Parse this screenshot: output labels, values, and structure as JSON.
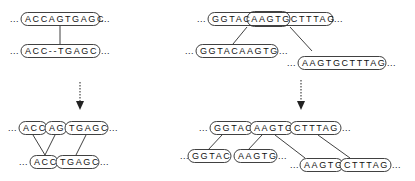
{
  "figure": {
    "background_color": "#ffffff",
    "box_stroke_color": "#2b2b2b",
    "text_color": "#111111",
    "arrow_color": "#333333",
    "ellipsis": "..."
  },
  "panels": [
    {
      "id": "left-panel",
      "name": "left-example",
      "before": {
        "rows": [
          {
            "id": "left-before-row-1",
            "segments": [
              {
                "id": "left-before-seq-1",
                "text": "ACCAGTGAGC",
                "boxed": true
              }
            ]
          },
          {
            "id": "left-before-row-2",
            "segments": [
              {
                "id": "left-before-seq-2",
                "text": "ACC--TGAGC",
                "boxed": true
              }
            ]
          }
        ]
      },
      "arrow": {
        "id": "left-arrow",
        "direction": "down",
        "style": "dotted"
      },
      "after": {
        "rows": [
          {
            "id": "left-after-row-1",
            "segments": [
              {
                "id": "left-after-seg-1",
                "text": "ACC",
                "boxed": true
              },
              {
                "id": "left-after-seg-2",
                "text": "AG",
                "boxed": true
              },
              {
                "id": "left-after-seg-3",
                "text": "TGAGC",
                "boxed": true
              }
            ]
          },
          {
            "id": "left-after-row-2",
            "segments": [
              {
                "id": "left-after-seg-4",
                "text": "ACC",
                "boxed": true
              },
              {
                "id": "left-after-seg-5",
                "text": "TGAGC",
                "boxed": true
              }
            ]
          }
        ]
      }
    },
    {
      "id": "right-panel",
      "name": "right-example",
      "before": {
        "rows": [
          {
            "id": "right-before-row-1",
            "segments": [
              {
                "id": "right-before-seq-1",
                "text": "GGTACAAGTGCTTTAG",
                "boxed": true
              },
              {
                "id": "right-before-inner-box",
                "text": "AAGTG",
                "boxed": true,
                "inner": true
              }
            ]
          },
          {
            "id": "right-before-row-2",
            "segments": [
              {
                "id": "right-before-seq-2",
                "text": "GGTACAAGTG",
                "boxed": true
              }
            ]
          },
          {
            "id": "right-before-row-3",
            "segments": [
              {
                "id": "right-before-seq-3",
                "text": "AAGTGCTTTAG",
                "boxed": true
              }
            ]
          }
        ]
      },
      "arrow": {
        "id": "right-arrow",
        "direction": "down",
        "style": "dotted"
      },
      "after": {
        "rows": [
          {
            "id": "right-after-row-1",
            "segments": [
              {
                "id": "right-after-seg-1",
                "text": "GGTAC",
                "boxed": true
              },
              {
                "id": "right-after-seg-2",
                "text": "AAGTG",
                "boxed": true
              },
              {
                "id": "right-after-seg-3",
                "text": "CTTTAG",
                "boxed": true
              }
            ]
          },
          {
            "id": "right-after-row-2",
            "segments": [
              {
                "id": "right-after-seg-4",
                "text": "GGTAC",
                "boxed": true
              },
              {
                "id": "right-after-seg-5",
                "text": "AAGTG",
                "boxed": true
              }
            ]
          },
          {
            "id": "right-after-row-3",
            "segments": [
              {
                "id": "right-after-seg-6",
                "text": "AAGTG",
                "boxed": true
              },
              {
                "id": "right-after-seg-7",
                "text": "CTTTAG",
                "boxed": true
              }
            ]
          }
        ]
      }
    }
  ]
}
